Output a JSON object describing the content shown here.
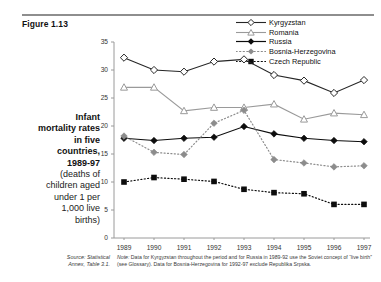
{
  "figure": {
    "label": "Figure 1.13"
  },
  "caption": {
    "bold_lines": [
      "Infant",
      "mortality rates",
      "in five",
      "countries,",
      "1989-97"
    ],
    "regular_lines": [
      "(deaths of",
      "children aged",
      "under 1 per",
      "1,000 live",
      "births)"
    ]
  },
  "source": {
    "line1": "Source: Statistical",
    "line2": "Annex, Table 3.1."
  },
  "note": {
    "prefix": "Note:",
    "text": " Data for Kyrgyzstan throughout the period and for Russia in 1989-92 use the Soviet concept of “live birth” (see Glossary). Data for Bosnia-Herzegovina for 1992-97 exclude Republika Srpska."
  },
  "legend": {
    "position": "top-right",
    "items": [
      {
        "label": "Kyrgyzstan",
        "marker": "open-diamond",
        "line": "solid",
        "color": "#262626"
      },
      {
        "label": "Romania",
        "marker": "open-triangle",
        "line": "solid",
        "color": "#9a9a9a"
      },
      {
        "label": "Russia",
        "marker": "filled-diamond",
        "line": "solid",
        "color": "#0d0d0d"
      },
      {
        "label": "Bosnia-Herzegovina",
        "marker": "filled-diamond",
        "line": "dotted",
        "color": "#8c8c8c"
      },
      {
        "label": "Czech Republic",
        "marker": "filled-square",
        "line": "dotted",
        "color": "#0d0d0d"
      }
    ]
  },
  "chart_data": {
    "type": "line",
    "title": "Infant mortality rates in five countries, 1989-97",
    "xlabel": "",
    "ylabel": "",
    "ylim": [
      0,
      35
    ],
    "yticks": [
      0,
      5,
      10,
      15,
      20,
      25,
      30,
      35
    ],
    "grid": false,
    "categories": [
      "1989",
      "1990",
      "1991",
      "1992",
      "1993",
      "1994",
      "1995",
      "1996",
      "1997"
    ],
    "series": [
      {
        "name": "Kyrgyzstan",
        "color": "#262626",
        "marker": "open-diamond",
        "line": "solid",
        "values": [
          32.2,
          30.0,
          29.7,
          31.5,
          31.9,
          29.1,
          28.1,
          25.9,
          28.2
        ]
      },
      {
        "name": "Romania",
        "color": "#9a9a9a",
        "marker": "open-triangle",
        "line": "solid",
        "values": [
          26.9,
          26.9,
          22.7,
          23.3,
          23.3,
          23.9,
          21.2,
          22.3,
          22.0
        ]
      },
      {
        "name": "Russia",
        "color": "#0d0d0d",
        "marker": "filled-diamond",
        "line": "solid",
        "values": [
          17.8,
          17.4,
          17.8,
          18.0,
          19.9,
          18.6,
          17.8,
          17.4,
          17.2
        ]
      },
      {
        "name": "Bosnia-Herzegovina",
        "color": "#8c8c8c",
        "marker": "filled-diamond",
        "line": "dotted",
        "values": [
          18.2,
          15.3,
          14.9,
          20.5,
          22.8,
          14.0,
          13.4,
          12.7,
          12.9
        ]
      },
      {
        "name": "Czech Republic",
        "color": "#0d0d0d",
        "marker": "filled-square",
        "line": "dotted",
        "values": [
          10.0,
          10.8,
          10.5,
          10.1,
          8.7,
          8.1,
          7.9,
          6.0,
          6.0
        ]
      }
    ]
  }
}
